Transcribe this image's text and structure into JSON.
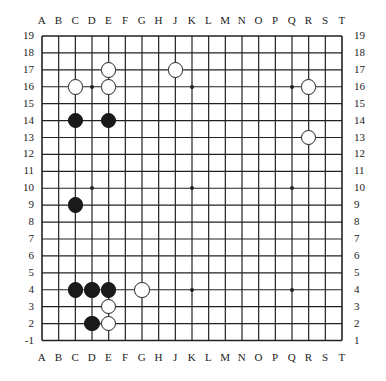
{
  "board": {
    "size": 19,
    "columns": [
      "A",
      "B",
      "C",
      "D",
      "E",
      "F",
      "G",
      "H",
      "J",
      "K",
      "L",
      "M",
      "N",
      "O",
      "P",
      "Q",
      "R",
      "S",
      "T"
    ],
    "rows_left": [
      "19",
      "18",
      "17",
      "16",
      "15",
      "14",
      "13",
      "12",
      "11",
      "10",
      "9",
      "8",
      "7",
      "6",
      "5",
      "4",
      "3",
      "2",
      "-1"
    ],
    "rows_right": [
      "19",
      "18",
      "17",
      "16",
      "15",
      "14",
      "13",
      "12",
      "11",
      "10",
      "9",
      "8",
      "7",
      "6",
      "5",
      "4",
      "3",
      "2",
      "1"
    ],
    "star_points": [
      [
        "D",
        16
      ],
      [
        "K",
        16
      ],
      [
        "Q",
        16
      ],
      [
        "D",
        10
      ],
      [
        "K",
        10
      ],
      [
        "Q",
        10
      ],
      [
        "D",
        4
      ],
      [
        "K",
        4
      ],
      [
        "Q",
        4
      ]
    ],
    "stones": [
      {
        "color": "white",
        "col": "E",
        "row": 17
      },
      {
        "color": "white",
        "col": "J",
        "row": 17
      },
      {
        "color": "white",
        "col": "C",
        "row": 16
      },
      {
        "color": "white",
        "col": "E",
        "row": 16
      },
      {
        "color": "white",
        "col": "R",
        "row": 16
      },
      {
        "color": "black",
        "col": "C",
        "row": 14
      },
      {
        "color": "black",
        "col": "E",
        "row": 14
      },
      {
        "color": "white",
        "col": "R",
        "row": 13
      },
      {
        "color": "black",
        "col": "C",
        "row": 9
      },
      {
        "color": "black",
        "col": "C",
        "row": 4
      },
      {
        "color": "black",
        "col": "D",
        "row": 4
      },
      {
        "color": "black",
        "col": "E",
        "row": 4
      },
      {
        "color": "white",
        "col": "G",
        "row": 4
      },
      {
        "color": "white",
        "col": "E",
        "row": 3
      },
      {
        "color": "black",
        "col": "D",
        "row": 2
      },
      {
        "color": "white",
        "col": "E",
        "row": 2
      }
    ]
  },
  "colors": {
    "line": "#222222",
    "black_stone": "#1a1a1a",
    "white_stone": "#ffffff",
    "background": "#ffffff"
  }
}
